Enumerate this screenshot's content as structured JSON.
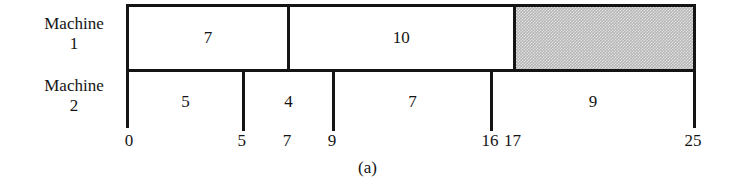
{
  "figure": {
    "caption": "(a)",
    "row_labels": [
      {
        "line1": "Machine",
        "line2": "1"
      },
      {
        "line1": "Machine",
        "line2": "2"
      }
    ]
  },
  "chart_data": {
    "type": "bar",
    "subtype": "gantt",
    "title": "",
    "caption": "(a)",
    "xlabel": "",
    "ylabel": "",
    "xlim": [
      0,
      25
    ],
    "grid": false,
    "legend": "none",
    "colors": {
      "task_fill": "#ffffff",
      "idle_fill": "#b6b6b6",
      "outline": "#141414"
    },
    "axis_ticks": [
      {
        "value": 0,
        "label": "0"
      },
      {
        "value": 5,
        "label": "5"
      },
      {
        "value": 7,
        "label": "7"
      },
      {
        "value": 9,
        "label": "9"
      },
      {
        "value": 16,
        "label": "16"
      },
      {
        "value": 17,
        "label": "17"
      },
      {
        "value": 25,
        "label": "25"
      }
    ],
    "rows": [
      {
        "name": "Machine 1",
        "blocks": [
          {
            "label": "7",
            "start": 0,
            "end": 7,
            "duration": 7,
            "kind": "task"
          },
          {
            "label": "10",
            "start": 7,
            "end": 17,
            "duration": 10,
            "kind": "task"
          },
          {
            "label": "",
            "start": 17,
            "end": 25,
            "duration": 8,
            "kind": "idle"
          }
        ]
      },
      {
        "name": "Machine 2",
        "blocks": [
          {
            "label": "5",
            "start": 0,
            "end": 5,
            "duration": 5,
            "kind": "task"
          },
          {
            "label": "4",
            "start": 5,
            "end": 9,
            "duration": 4,
            "kind": "task"
          },
          {
            "label": "7",
            "start": 9,
            "end": 16,
            "duration": 7,
            "kind": "task"
          },
          {
            "label": "9",
            "start": 16,
            "end": 25,
            "duration": 9,
            "kind": "task"
          }
        ]
      }
    ]
  }
}
